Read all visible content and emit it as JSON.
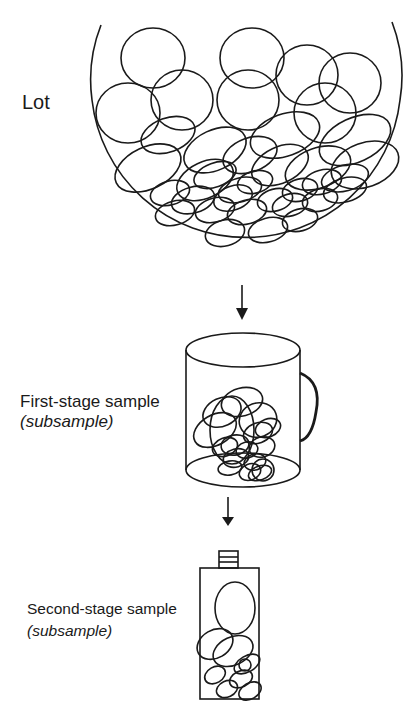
{
  "labels": {
    "lot": "Lot",
    "first_stage": "First-stage sample",
    "first_stage_sub": "(subsample)",
    "second_stage": "Second-stage sample",
    "second_stage_sub": "(subsample)"
  },
  "colors": {
    "stroke": "#1a1a1a",
    "background": "#ffffff"
  },
  "lot_particles": [
    [
      153,
      58,
      32,
      30,
      0
    ],
    [
      252,
      58,
      32,
      30,
      0
    ],
    [
      307,
      75,
      31,
      30,
      0
    ],
    [
      350,
      83,
      31,
      30,
      0
    ],
    [
      128,
      113,
      32,
      30,
      0
    ],
    [
      182,
      100,
      31,
      30,
      0
    ],
    [
      248,
      100,
      31,
      30,
      0
    ],
    [
      325,
      113,
      31,
      30,
      0
    ],
    [
      168,
      135,
      28,
      17,
      -20
    ],
    [
      215,
      150,
      33,
      20,
      -25
    ],
    [
      285,
      135,
      36,
      21,
      -20
    ],
    [
      355,
      140,
      38,
      22,
      -25
    ],
    [
      148,
      168,
      35,
      21,
      -25
    ],
    [
      205,
      180,
      30,
      18,
      -25
    ],
    [
      250,
      155,
      28,
      17,
      -20
    ],
    [
      280,
      165,
      30,
      18,
      -25
    ],
    [
      318,
      168,
      34,
      20,
      -20
    ],
    [
      365,
      165,
      35,
      22,
      -20
    ],
    [
      215,
      175,
      22,
      12,
      -20
    ],
    [
      240,
      190,
      22,
      12,
      -15
    ],
    [
      170,
      193,
      20,
      12,
      -15
    ],
    [
      193,
      200,
      22,
      13,
      -15
    ],
    [
      255,
      182,
      18,
      11,
      -15
    ],
    [
      233,
      198,
      20,
      12,
      -20
    ],
    [
      275,
      200,
      18,
      11,
      -15
    ],
    [
      300,
      190,
      18,
      11,
      -15
    ],
    [
      322,
      182,
      20,
      12,
      -15
    ],
    [
      345,
      178,
      24,
      13,
      -15
    ],
    [
      175,
      213,
      20,
      12,
      -15
    ],
    [
      215,
      210,
      20,
      12,
      -15
    ],
    [
      247,
      212,
      20,
      12,
      -15
    ],
    [
      290,
      205,
      18,
      11,
      -15
    ],
    [
      320,
      200,
      18,
      11,
      -15
    ],
    [
      300,
      220,
      18,
      11,
      -15
    ],
    [
      225,
      233,
      20,
      13,
      -15
    ],
    [
      268,
      230,
      20,
      12,
      -15
    ],
    [
      345,
      190,
      22,
      12,
      -15
    ]
  ],
  "mug_particles": [
    [
      222,
      412,
      20,
      14,
      -25
    ],
    [
      242,
      402,
      21,
      14,
      -15
    ],
    [
      232,
      430,
      22,
      34,
      0
    ],
    [
      215,
      430,
      23,
      15,
      -30
    ],
    [
      258,
      420,
      19,
      17,
      -20
    ],
    [
      235,
      445,
      14,
      10,
      -10
    ],
    [
      258,
      433,
      15,
      10,
      -20
    ],
    [
      268,
      428,
      13,
      9,
      -20
    ],
    [
      225,
      447,
      13,
      9,
      -20
    ],
    [
      247,
      450,
      11,
      8,
      -15
    ],
    [
      262,
      447,
      13,
      10,
      -15
    ],
    [
      236,
      458,
      13,
      9,
      -15
    ],
    [
      255,
      462,
      11,
      8,
      -15
    ],
    [
      230,
      468,
      12,
      7,
      -10
    ],
    [
      250,
      472,
      11,
      8,
      -20
    ],
    [
      260,
      473,
      12,
      7,
      -20
    ],
    [
      263,
      470,
      11,
      11,
      0
    ]
  ],
  "bottle_particles": [
    [
      235,
      608,
      20,
      26,
      0
    ],
    [
      215,
      644,
      19,
      14,
      -30
    ],
    [
      233,
      651,
      21,
      14,
      -25
    ],
    [
      247,
      664,
      14,
      8,
      -30
    ],
    [
      245,
      665,
      6,
      6,
      0
    ],
    [
      215,
      675,
      11,
      8,
      -30
    ],
    [
      227,
      689,
      11,
      8,
      -25
    ],
    [
      241,
      679,
      12,
      8,
      -25
    ],
    [
      250,
      691,
      12,
      8,
      -30
    ]
  ]
}
